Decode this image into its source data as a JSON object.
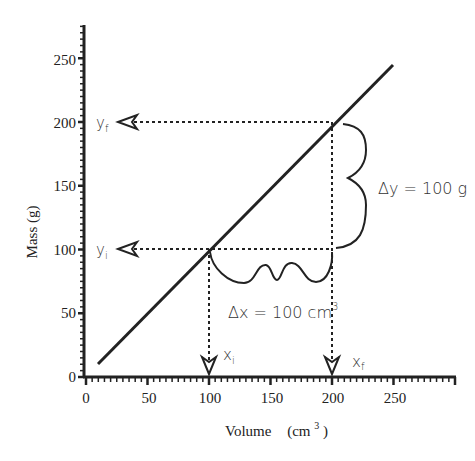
{
  "chart_data": {
    "type": "line",
    "title": "",
    "xlabel": "Volume  (cm3)",
    "ylabel": "Mass  (g)",
    "xlim": [
      0,
      300
    ],
    "ylim": [
      0,
      280
    ],
    "x_ticks": [
      0,
      50,
      100,
      150,
      200,
      250
    ],
    "y_ticks": [
      0,
      50,
      100,
      150,
      200,
      250
    ],
    "grid": false,
    "legend": null,
    "series": [
      {
        "name": "Mass vs Volume",
        "x": [
          10,
          250
        ],
        "y": [
          10,
          250
        ]
      }
    ],
    "annotations": {
      "points": [
        {
          "label_x": "xi",
          "label_y": "yi",
          "x": 100,
          "y": 100
        },
        {
          "label_x": "xf",
          "label_y": "yf",
          "x": 200,
          "y": 200
        }
      ],
      "delta_x": "Δx = 100 cm3",
      "delta_y": "Δy = 100 g"
    }
  },
  "labels": {
    "xlabel_main": "Volume",
    "xlabel_unit": "(cm",
    "xlabel_sup": "3",
    "xlabel_close": ")",
    "ylabel": "Mass  (g)",
    "x_ticks": [
      "0",
      "50",
      "100",
      "150",
      "200",
      "250"
    ],
    "y_ticks": [
      "0",
      "50",
      "100",
      "150",
      "200",
      "250"
    ],
    "yf": "y",
    "yf_sub": "f",
    "yi": "y",
    "yi_sub": "i",
    "xi": "x",
    "xi_sub": "i",
    "xf": "x",
    "xf_sub": "f",
    "delta_x": "Δx = 100 cm",
    "delta_x_sup": "3",
    "delta_y": "Δy = 100 g"
  }
}
